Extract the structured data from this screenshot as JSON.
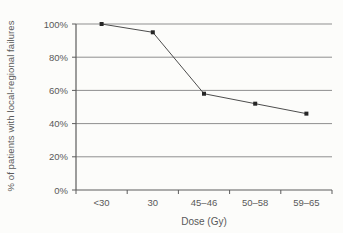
{
  "chart_data": {
    "type": "line",
    "title": "",
    "categories": [
      "<30",
      "30",
      "45–46",
      "50–58",
      "59–65"
    ],
    "values": [
      100,
      95,
      58,
      52,
      46
    ],
    "xlabel": "Dose (Gy)",
    "ylabel": "% of patients with local-regional failures",
    "ylim": [
      0,
      100
    ],
    "ytick_labels": [
      "0%",
      "20%",
      "40%",
      "60%",
      "80%",
      "100%"
    ],
    "grid": true,
    "legend": false,
    "colors": {
      "gridline": "#8f8f8f",
      "axis": "#5c5c5c",
      "series_line": "#4d4d4d",
      "marker": "#262626",
      "text": "#595959",
      "background": "#fcfcfa"
    }
  }
}
